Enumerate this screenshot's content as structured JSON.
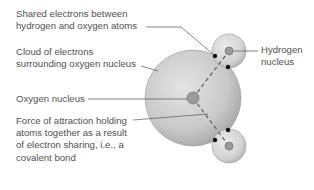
{
  "diagram": {
    "labels": {
      "shared_electrons": "Shared electrons between\nhydrogen and oxygen atoms",
      "electron_cloud": "Cloud of electrons\nsurrounding oxygen nucleus",
      "oxygen_nucleus": "Oxygen nucleus",
      "force_of_attraction": "Force of attraction holding\natoms together as a result\nof electron sharing, i.e., a\ncovalent bond",
      "hydrogen_nucleus": "Hydrogen\nnucleus"
    },
    "colors": {
      "oxygen_cloud": "#c8c8c8",
      "hydrogen_cloud": "#d6d6d6",
      "nucleus": "#9a9a9a",
      "shared_electron": "#111111",
      "leader_line": "#555555",
      "bond_dash": "#666666"
    }
  }
}
